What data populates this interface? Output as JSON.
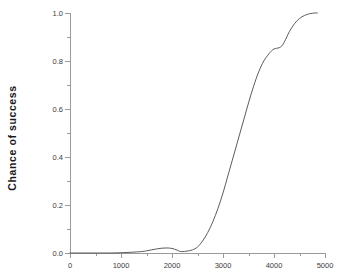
{
  "chart_data": {
    "type": "line",
    "title": "",
    "subtitle": "",
    "xlabel": "",
    "ylabel": "Chance of  success",
    "xlim": [
      0,
      5000
    ],
    "ylim": [
      0.0,
      1.0
    ],
    "grid": false,
    "legend": null,
    "legend_position": "none",
    "line_color": "#4a4a4a",
    "axis_color": "#9a9a9a",
    "background_color": "#ffffff",
    "xticks": [
      0,
      1000,
      2000,
      3000,
      4000,
      5000
    ],
    "xtick_labels": [
      "0",
      "1000",
      "2000",
      "3000",
      "4000",
      "5000"
    ],
    "xminor_ticks": [
      500,
      1500,
      2500,
      3500,
      4500
    ],
    "yticks": [
      0.0,
      0.2,
      0.4,
      0.6,
      0.8,
      1.0
    ],
    "ytick_labels": [
      "0.0",
      "0.2",
      "0.4",
      "0.6",
      "0.8",
      "1.0"
    ],
    "yminor_ticks": [
      0.1,
      0.3,
      0.5,
      0.7,
      0.9
    ],
    "series": [
      {
        "name": "chance of success",
        "x": [
          0,
          200,
          400,
          600,
          800,
          1000,
          1200,
          1400,
          1500,
          1600,
          1700,
          1800,
          1900,
          2000,
          2100,
          2150,
          2200,
          2300,
          2400,
          2500,
          2600,
          2700,
          2800,
          2900,
          3000,
          3100,
          3200,
          3300,
          3400,
          3500,
          3600,
          3700,
          3800,
          3900,
          3950,
          4000,
          4050,
          4100,
          4150,
          4200,
          4250,
          4300,
          4400,
          4500,
          4600,
          4700,
          4800,
          4850
        ],
        "y": [
          0.0,
          0.0,
          0.0,
          0.0,
          0.0,
          0.001,
          0.003,
          0.006,
          0.009,
          0.013,
          0.017,
          0.02,
          0.021,
          0.019,
          0.012,
          0.007,
          0.006,
          0.008,
          0.013,
          0.025,
          0.05,
          0.085,
          0.13,
          0.185,
          0.25,
          0.325,
          0.4,
          0.475,
          0.55,
          0.625,
          0.695,
          0.755,
          0.8,
          0.83,
          0.842,
          0.85,
          0.853,
          0.855,
          0.862,
          0.878,
          0.9,
          0.922,
          0.955,
          0.977,
          0.99,
          0.997,
          1.0,
          1.0
        ]
      }
    ]
  }
}
